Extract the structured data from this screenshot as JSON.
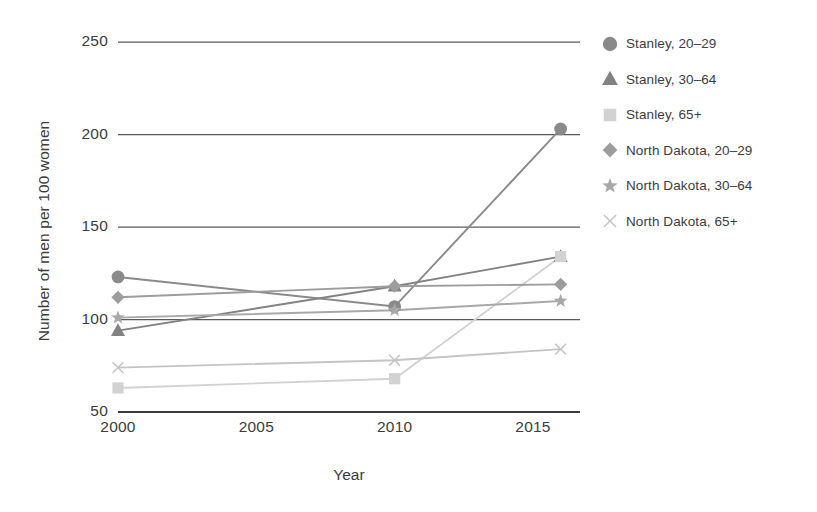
{
  "chart_data": {
    "type": "line",
    "title": "",
    "xlabel": "Year",
    "ylabel": "Number of men per 100 women",
    "x": [
      2000,
      2010,
      2016
    ],
    "xlim": [
      2000,
      2016.7
    ],
    "ylim": [
      50,
      250
    ],
    "yticks": [
      50,
      100,
      150,
      200,
      250
    ],
    "xticks": [
      2000,
      2005,
      2010,
      2015
    ],
    "xtick_labels": [
      "2000",
      "2005",
      "2010",
      "2015"
    ],
    "ytick_labels": [
      "50",
      "100",
      "150",
      "200",
      "250"
    ],
    "grid": "horizontal",
    "legend_position": "right",
    "series": [
      {
        "name": "Stanley, 20–29",
        "marker": "circle",
        "color": "#8a8a8a",
        "values": [
          123,
          107,
          203
        ]
      },
      {
        "name": "Stanley, 30–64",
        "marker": "triangle",
        "color": "#828282",
        "values": [
          94,
          118,
          134
        ]
      },
      {
        "name": "Stanley, 65+",
        "marker": "square",
        "color": "#d2d2d2",
        "values": [
          63,
          68,
          134
        ]
      },
      {
        "name": "North Dakota, 20–29",
        "marker": "diamond",
        "color": "#9d9d9d",
        "values": [
          112,
          118,
          119
        ]
      },
      {
        "name": "North Dakota, 30–64",
        "marker": "star",
        "color": "#a8a8a8",
        "values": [
          101,
          105,
          110
        ]
      },
      {
        "name": "North Dakota, 65+",
        "marker": "cross",
        "color": "#c4c4c4",
        "values": [
          74,
          78,
          84
        ]
      }
    ]
  },
  "legend": {
    "items": [
      {
        "label": "Stanley, 20–29"
      },
      {
        "label": "Stanley, 30–64"
      },
      {
        "label": "Stanley, 65+"
      },
      {
        "label": "North Dakota, 20–29"
      },
      {
        "label": "North Dakota, 30–64"
      },
      {
        "label": "North Dakota, 65+"
      }
    ]
  },
  "axes": {
    "x_title": "Year",
    "y_title": "Number of men per 100 women"
  },
  "colors": {
    "grid": "#4a4a4a",
    "text": "#3c3c3c",
    "background": "#ffffff"
  }
}
